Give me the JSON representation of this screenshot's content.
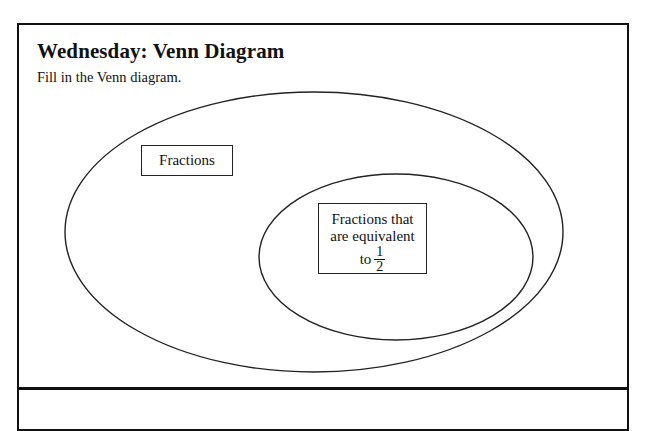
{
  "worksheet": {
    "title": "Wednesday: Venn Diagram",
    "instruction": "Fill in the Venn diagram."
  },
  "venn": {
    "outer_set": {
      "label": "Fractions"
    },
    "inner_set": {
      "label_line1": "Fractions that",
      "label_line2": "are equivalent",
      "label_prefix": "to",
      "fraction_numerator": "1",
      "fraction_denominator": "2"
    }
  }
}
